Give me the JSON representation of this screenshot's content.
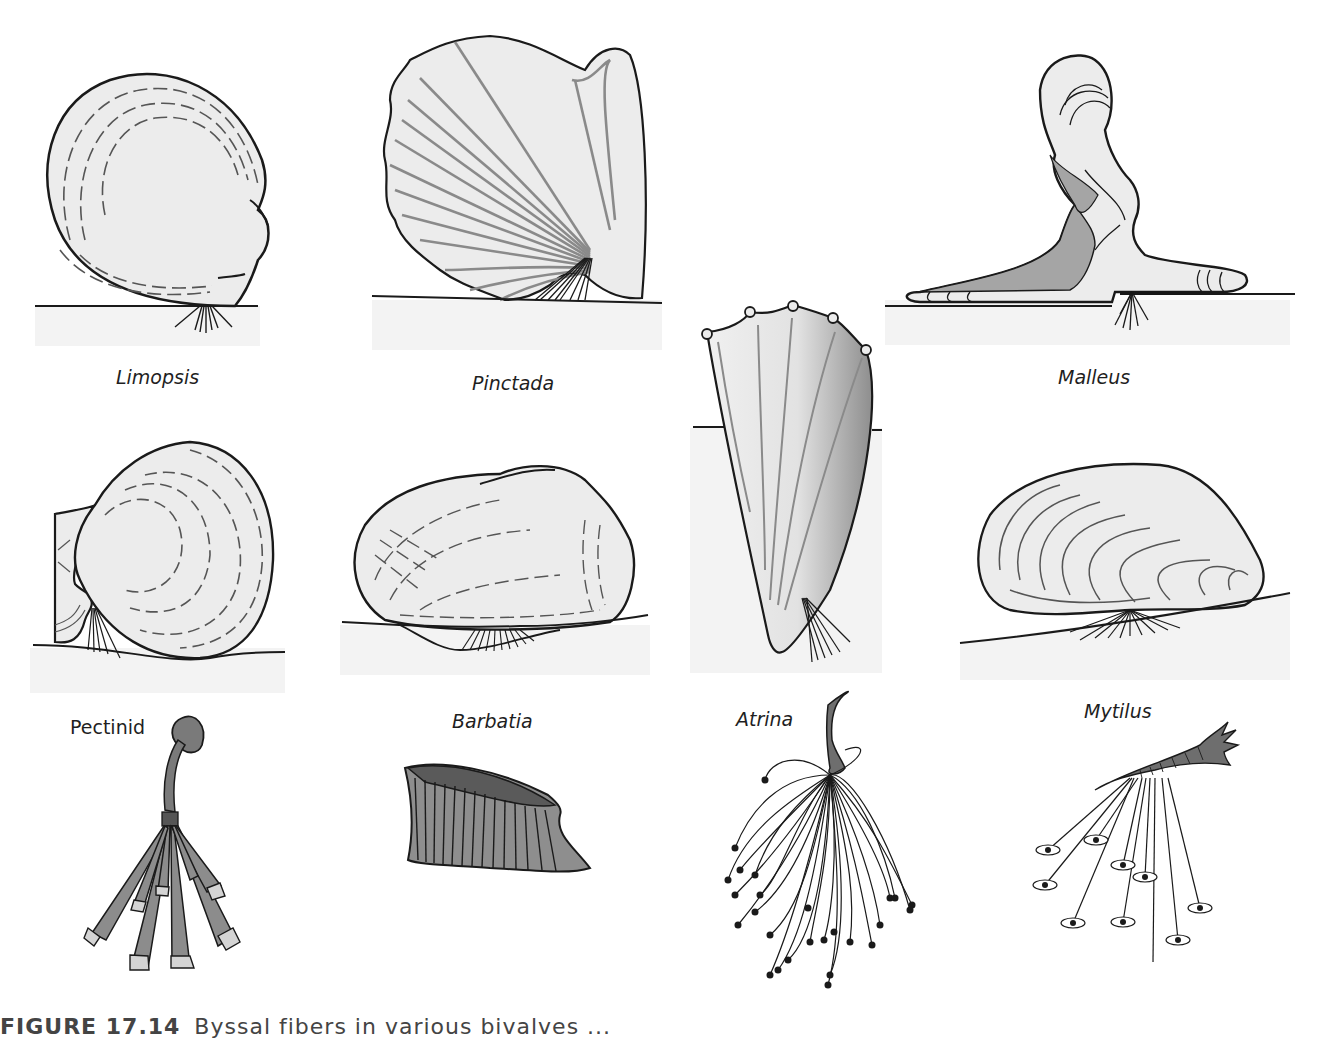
{
  "figure": {
    "caption_number": "FIGURE 17.14",
    "caption_text": "Byssal fibers in various bivalves ..."
  },
  "colors": {
    "shell_fill": "#ececec",
    "sediment_fill": "#f3f3f3",
    "outline": "#1a1a1a",
    "rib_gray": "#8a8a8a",
    "byssus_dark": "#6e6e6e",
    "byssus_mid": "#9a9a9a",
    "byssus_tip": "#d4d4d4"
  },
  "panels": [
    {
      "id": "limopsis",
      "label": "Limopsis",
      "style": "italic",
      "row": 1
    },
    {
      "id": "pinctada",
      "label": "Pinctada",
      "style": "italic",
      "row": 1
    },
    {
      "id": "malleus",
      "label": "Malleus",
      "style": "italic",
      "row": 1
    },
    {
      "id": "pectinid-shell",
      "label": "",
      "row": 2
    },
    {
      "id": "barbatia-shell",
      "label": "",
      "row": 2
    },
    {
      "id": "atrina-shell",
      "label": "",
      "row": 1.5
    },
    {
      "id": "mytilus-shell",
      "label": "",
      "row": 2
    },
    {
      "id": "pectinid-byssus",
      "label": "Pectinid",
      "style": "upright",
      "row": 3
    },
    {
      "id": "barbatia-byssus",
      "label": "Barbatia",
      "style": "italic",
      "row": 3
    },
    {
      "id": "atrina-byssus",
      "label": "Atrina",
      "style": "italic",
      "row": 3
    },
    {
      "id": "mytilus-byssus",
      "label": "Mytilus",
      "style": "italic",
      "row": 3
    }
  ]
}
